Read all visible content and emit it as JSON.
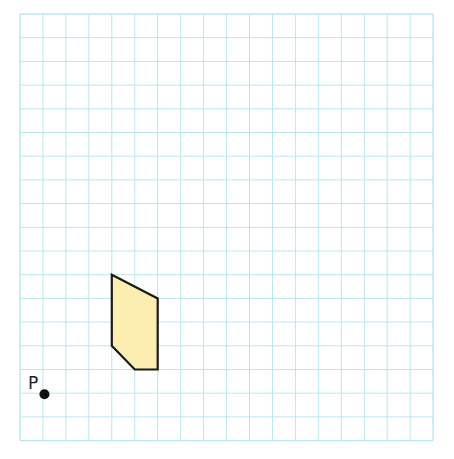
{
  "diagram": {
    "type": "grid-figure",
    "grid": {
      "columns": 18,
      "rows": 18,
      "origin_px": [
        20,
        14
      ],
      "cell_w": 22.95,
      "cell_h": 23.7,
      "line_color": "#b8e8ee",
      "border_color": "#a8e0e8"
    },
    "shape": {
      "label": "",
      "vertices_grid": [
        [
          4,
          11
        ],
        [
          6,
          12
        ],
        [
          6,
          15
        ],
        [
          5,
          15
        ],
        [
          4,
          14
        ]
      ],
      "fill": "#fbeeb0",
      "stroke": "#1a1a1a",
      "stroke_width": 2.2
    },
    "point": {
      "label": "P",
      "position_grid": [
        1,
        16
      ],
      "color": "#111111"
    }
  }
}
